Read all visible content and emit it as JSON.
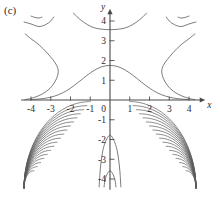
{
  "figure": {
    "panel_label": "(c)",
    "background_color": "#ffffff",
    "curve_color": "#5a5a5a",
    "axis_color": "#4a4a4a",
    "text_color": "#2b2b2b"
  },
  "axes": {
    "x_name": "x",
    "y_name": "y",
    "origin_label": "0",
    "x_ticks": [
      {
        "value": -4,
        "label": "-4"
      },
      {
        "value": -3,
        "label": "-3"
      },
      {
        "value": -2,
        "label": "-2"
      },
      {
        "value": -1,
        "label": "-1"
      },
      {
        "value": 1,
        "label": "1"
      },
      {
        "value": 2,
        "label": "2"
      },
      {
        "value": 3,
        "label": "3"
      },
      {
        "value": 4,
        "label": "4"
      }
    ],
    "y_ticks": [
      {
        "value": 4,
        "label": "4"
      },
      {
        "value": 3,
        "label": "3"
      },
      {
        "value": 2,
        "label": "2"
      },
      {
        "value": 1,
        "label": "1"
      },
      {
        "value": -1,
        "label": "-1"
      },
      {
        "value": -2,
        "label": "-2"
      },
      {
        "value": -3,
        "label": "-3"
      },
      {
        "value": -4,
        "label": "-4"
      }
    ],
    "has_x_arrow": true,
    "has_y_arrow": true
  },
  "chart_data": {
    "type": "line",
    "title": "",
    "subtitle": "",
    "xlabel": "x",
    "ylabel": "y",
    "xlim": [
      -4.4,
      4.4
    ],
    "ylim": [
      -4.4,
      4.4
    ],
    "grid": false,
    "legend": "none",
    "series": [
      {
        "name": "central-bell-curve",
        "comment": "peak at x=0, y=1.75; decays to y=0 near x=+/-4",
        "points": [
          [
            -4.0,
            0.02
          ],
          [
            -3.6,
            0.05
          ],
          [
            -3.2,
            0.1
          ],
          [
            -2.8,
            0.2
          ],
          [
            -2.4,
            0.36
          ],
          [
            -2.0,
            0.6
          ],
          [
            -1.6,
            0.9
          ],
          [
            -1.2,
            1.22
          ],
          [
            -0.8,
            1.5
          ],
          [
            -0.4,
            1.69
          ],
          [
            0.0,
            1.75
          ],
          [
            0.4,
            1.69
          ],
          [
            0.8,
            1.5
          ],
          [
            1.2,
            1.22
          ],
          [
            1.6,
            0.9
          ],
          [
            2.0,
            0.6
          ],
          [
            2.4,
            0.36
          ],
          [
            2.8,
            0.2
          ],
          [
            3.2,
            0.1
          ],
          [
            3.6,
            0.05
          ],
          [
            4.0,
            0.02
          ]
        ]
      },
      {
        "name": "upper-left-branch",
        "comment": "opens leftward, vertex near (-2.6, 1.6)",
        "points": [
          [
            -4.3,
            3.35
          ],
          [
            -4.0,
            3.1
          ],
          [
            -3.6,
            2.8
          ],
          [
            -3.2,
            2.4
          ],
          [
            -2.9,
            2.05
          ],
          [
            -2.7,
            1.75
          ],
          [
            -2.62,
            1.45
          ],
          [
            -2.7,
            1.1
          ],
          [
            -2.9,
            0.75
          ],
          [
            -3.2,
            0.45
          ],
          [
            -3.6,
            0.22
          ],
          [
            -4.0,
            0.08
          ],
          [
            -4.3,
            0.02
          ]
        ]
      },
      {
        "name": "upper-right-branch",
        "comment": "mirror of upper-left branch",
        "points": [
          [
            4.3,
            3.35
          ],
          [
            4.0,
            3.1
          ],
          [
            3.6,
            2.8
          ],
          [
            3.2,
            2.4
          ],
          [
            2.9,
            2.05
          ],
          [
            2.7,
            1.75
          ],
          [
            2.62,
            1.45
          ],
          [
            2.7,
            1.1
          ],
          [
            2.9,
            0.75
          ],
          [
            3.2,
            0.45
          ],
          [
            3.6,
            0.22
          ],
          [
            4.0,
            0.08
          ],
          [
            4.3,
            0.02
          ]
        ]
      },
      {
        "name": "top-center-arc",
        "comment": "downward-opening arc, minimum near (0, 3.55)",
        "points": [
          [
            -1.85,
            4.4
          ],
          [
            -1.6,
            4.15
          ],
          [
            -1.3,
            3.92
          ],
          [
            -1.0,
            3.74
          ],
          [
            -0.6,
            3.61
          ],
          [
            0.0,
            3.56
          ],
          [
            0.6,
            3.61
          ],
          [
            1.0,
            3.74
          ],
          [
            1.3,
            3.92
          ],
          [
            1.6,
            4.15
          ],
          [
            1.85,
            4.4
          ]
        ]
      },
      {
        "name": "top-left-arc-outer",
        "comment": "short arc in upper-left corner",
        "points": [
          [
            -4.35,
            3.95
          ],
          [
            -4.0,
            3.85
          ],
          [
            -3.6,
            3.72
          ],
          [
            -3.25,
            3.82
          ],
          [
            -3.0,
            4.0
          ],
          [
            -2.85,
            4.2
          ]
        ]
      },
      {
        "name": "top-left-arc-inner",
        "comment": "small fragment above the outer arc",
        "points": [
          [
            -4.0,
            4.25
          ],
          [
            -3.8,
            4.18
          ],
          [
            -3.6,
            4.15
          ],
          [
            -3.45,
            4.2
          ]
        ]
      },
      {
        "name": "top-right-arc-outer",
        "points": [
          [
            4.35,
            3.95
          ],
          [
            4.0,
            3.85
          ],
          [
            3.6,
            3.72
          ],
          [
            3.25,
            3.82
          ],
          [
            3.0,
            4.0
          ],
          [
            2.85,
            4.2
          ]
        ]
      },
      {
        "name": "top-right-arc-inner",
        "points": [
          [
            4.0,
            4.25
          ],
          [
            3.8,
            4.18
          ],
          [
            3.6,
            4.15
          ],
          [
            3.45,
            4.2
          ]
        ]
      },
      {
        "name": "lower-center-arc-upper",
        "comment": "small nested arc with apex near (0, -1.75)",
        "points": [
          [
            -0.55,
            -4.4
          ],
          [
            -0.5,
            -3.6
          ],
          [
            -0.42,
            -2.9
          ],
          [
            -0.28,
            -2.25
          ],
          [
            0.0,
            -1.78
          ],
          [
            0.28,
            -2.25
          ],
          [
            0.42,
            -2.9
          ],
          [
            0.5,
            -3.6
          ],
          [
            0.55,
            -4.4
          ]
        ]
      },
      {
        "name": "lower-center-arc-lower",
        "comment": "tiny nested arc with apex near (0, -3.55)",
        "points": [
          [
            -0.3,
            -4.4
          ],
          [
            -0.26,
            -4.1
          ],
          [
            -0.17,
            -3.8
          ],
          [
            0.0,
            -3.58
          ],
          [
            0.17,
            -3.8
          ],
          [
            0.26,
            -4.1
          ],
          [
            0.3,
            -4.4
          ]
        ]
      },
      {
        "name": "lower-left-family",
        "comment": "nested quarter-arc contours crowding into the lower-left corner; 18 curves with decreasing radius",
        "count": 18,
        "anchor_x": -4.35,
        "anchor_y": -4.4,
        "outer_reach": [
          -1.0,
          -0.08
        ],
        "inner_reach": [
          -3.85,
          -3.6
        ]
      },
      {
        "name": "lower-right-family",
        "comment": "mirror image of the lower-left family",
        "count": 18,
        "anchor_x": 4.35,
        "anchor_y": -4.4,
        "outer_reach": [
          1.0,
          -0.08
        ],
        "inner_reach": [
          3.85,
          -3.6
        ]
      }
    ]
  }
}
